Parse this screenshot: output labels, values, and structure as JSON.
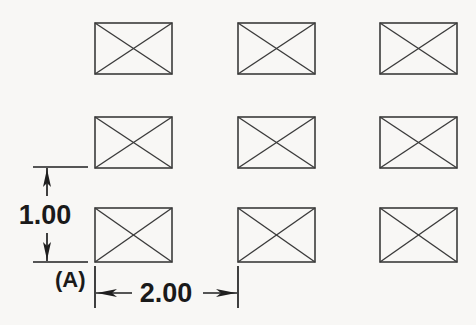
{
  "drawing": {
    "title": "Rectangular hole pattern with linear dimensions",
    "background_color": "#f8f7f5",
    "line_color": "#3b3b3b",
    "dimension_color": "#1f1f1f",
    "canvas": {
      "width": 476,
      "height": 325
    }
  },
  "pattern": {
    "label": "3 x 3 rectangular pattern",
    "rows": 3,
    "columns": 3,
    "feature_type": "crossed-rectangle",
    "feature_size": {
      "width": 77,
      "height": 51
    },
    "column_x": [
      95,
      238,
      380
    ],
    "row_y": [
      23,
      117,
      208
    ],
    "features": [
      {
        "id": "r1c1",
        "name": "feature-row1-col1",
        "x": 95,
        "y": 23
      },
      {
        "id": "r1c2",
        "name": "feature-row1-col2",
        "x": 238,
        "y": 23
      },
      {
        "id": "r1c3",
        "name": "feature-row1-col3",
        "x": 380,
        "y": 23
      },
      {
        "id": "r2c1",
        "name": "feature-row2-col1",
        "x": 95,
        "y": 117
      },
      {
        "id": "r2c2",
        "name": "feature-row2-col2",
        "x": 238,
        "y": 117
      },
      {
        "id": "r2c3",
        "name": "feature-row2-col3",
        "x": 380,
        "y": 117
      },
      {
        "id": "r3c1",
        "name": "feature-row3-col1",
        "x": 95,
        "y": 208
      },
      {
        "id": "r3c2",
        "name": "feature-row3-col2",
        "x": 238,
        "y": 208
      },
      {
        "id": "r3c3",
        "name": "feature-row3-col3",
        "x": 380,
        "y": 208
      }
    ]
  },
  "dimensions": {
    "vertical": {
      "name": "vertical-dimension-1-00",
      "value": "1.00",
      "orientation": "vertical",
      "text_x": 45,
      "text_y": 224,
      "dim_line_x": 47,
      "ext_top_y": 167,
      "ext_bottom_y": 262,
      "ext_x_start": 33,
      "ext_x_end": 88,
      "arrow_direction": "outward"
    },
    "horizontal": {
      "name": "horizontal-dimension-2-00",
      "value": "2.00",
      "orientation": "horizontal",
      "text_x": 166,
      "text_y": 302,
      "dim_line_y": 293,
      "ext_left_x": 95,
      "ext_right_x": 238,
      "ext_y_start": 266,
      "ext_y_end": 308,
      "arrow_direction": "outward"
    },
    "datum": {
      "name": "datum-label-a",
      "value": "(A)",
      "text_x": 55,
      "text_y": 287
    }
  }
}
